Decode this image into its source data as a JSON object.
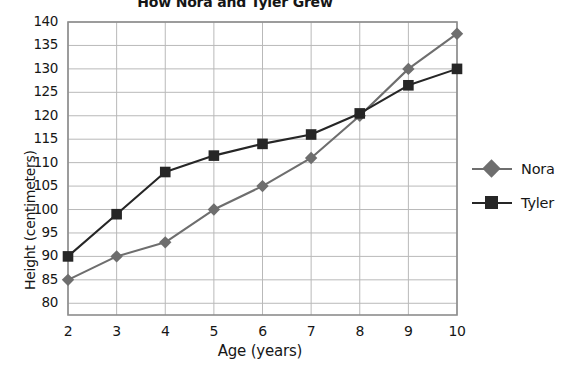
{
  "chart_data": {
    "type": "line",
    "title": "How Nora and Tyler Grew",
    "xlabel": "Age (years)",
    "ylabel": "Height (centimeters)",
    "x": [
      2,
      3,
      4,
      5,
      6,
      7,
      8,
      9,
      10
    ],
    "categories": [
      "2",
      "3",
      "4",
      "5",
      "6",
      "7",
      "8",
      "9",
      "10"
    ],
    "series": [
      {
        "name": "Nora",
        "color": "#6e6e6e",
        "marker": "diamond",
        "values": [
          85,
          90,
          93,
          100,
          105,
          111,
          120,
          130,
          137.5
        ]
      },
      {
        "name": "Tyler",
        "color": "#262626",
        "marker": "square",
        "values": [
          90,
          99,
          108,
          111.5,
          114,
          116,
          120.5,
          126.5,
          130
        ]
      }
    ],
    "xlim": [
      2,
      10
    ],
    "ylim": [
      77.5,
      140
    ],
    "ytick_labels": [
      "140",
      "135",
      "130",
      "125",
      "120",
      "115",
      "110",
      "105",
      "100",
      "95",
      "90",
      "85",
      "80"
    ],
    "ytick_values": [
      140,
      135,
      130,
      125,
      120,
      115,
      110,
      105,
      100,
      95,
      90,
      85,
      80
    ],
    "grid": true,
    "legend_position": "right",
    "gridline_color": "#b9b9b9",
    "axis_color": "#8d8d8d"
  }
}
